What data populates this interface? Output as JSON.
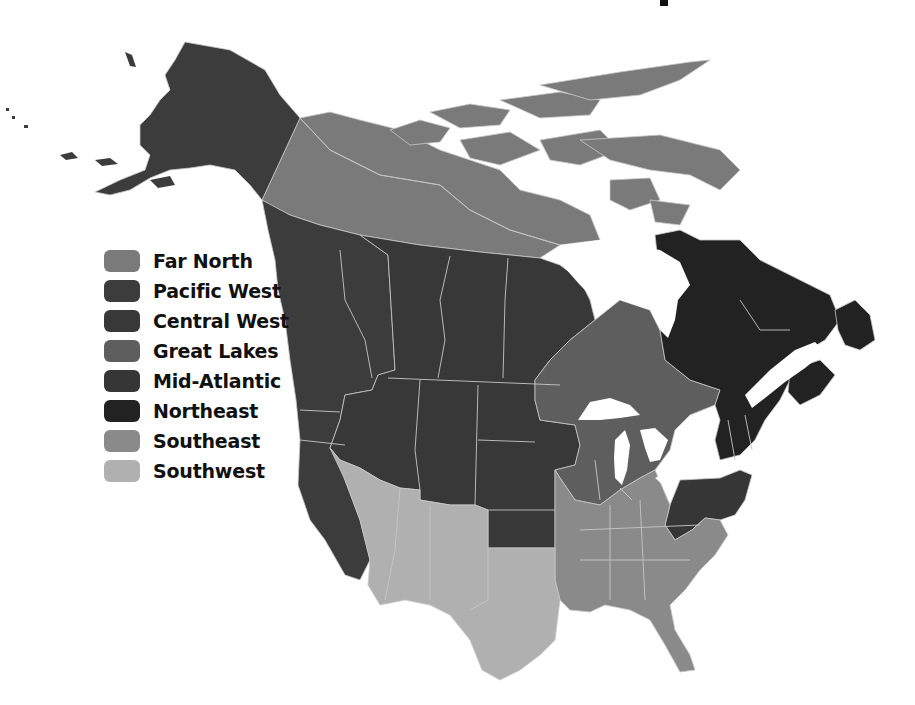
{
  "title_fragment": "",
  "legend": {
    "items": [
      {
        "id": "far-north",
        "label": "Far North",
        "color": "#7a7a7a"
      },
      {
        "id": "pacific-west",
        "label": "Pacific West",
        "color": "#3c3c3c"
      },
      {
        "id": "central-west",
        "label": "Central West",
        "color": "#383838"
      },
      {
        "id": "great-lakes",
        "label": "Great Lakes",
        "color": "#5e5e5e"
      },
      {
        "id": "mid-atlantic",
        "label": "Mid-Atlantic",
        "color": "#363636"
      },
      {
        "id": "northeast",
        "label": "Northeast",
        "color": "#222222"
      },
      {
        "id": "southeast",
        "label": "Southeast",
        "color": "#8a8a8a"
      },
      {
        "id": "southwest",
        "label": "Southwest",
        "color": "#b0b0b0"
      }
    ]
  },
  "map": {
    "subject": "North America regional map (Canada and contiguous United States plus Alaska)",
    "regions": {
      "far_north": "Yukon, Northwest Territories, Nunavut and Arctic Archipelago",
      "pacific_west": "Alaska, British Columbia, Washington, Oregon, California",
      "central_west": "Alberta, Saskatchewan, Manitoba, Idaho, Montana, Wyoming, Dakotas, Nebraska, Kansas, Iowa",
      "great_lakes": "Ontario, Minnesota, Wisconsin, Michigan, Illinois, Indiana, Ohio",
      "mid_atlantic": "Pennsylvania, New Jersey, Maryland, Delaware, West Virginia",
      "northeast": "Quebec, Labrador, Newfoundland, Maritimes, New York, New England",
      "southeast": "Missouri, Kentucky, Tennessee, Virginia, Carolinas, Arkansas, Louisiana, Mississippi, Alabama, Georgia, Florida",
      "southwest": "Nevada, Utah, Arizona, Colorado, New Mexico, Oklahoma, Texas"
    }
  }
}
